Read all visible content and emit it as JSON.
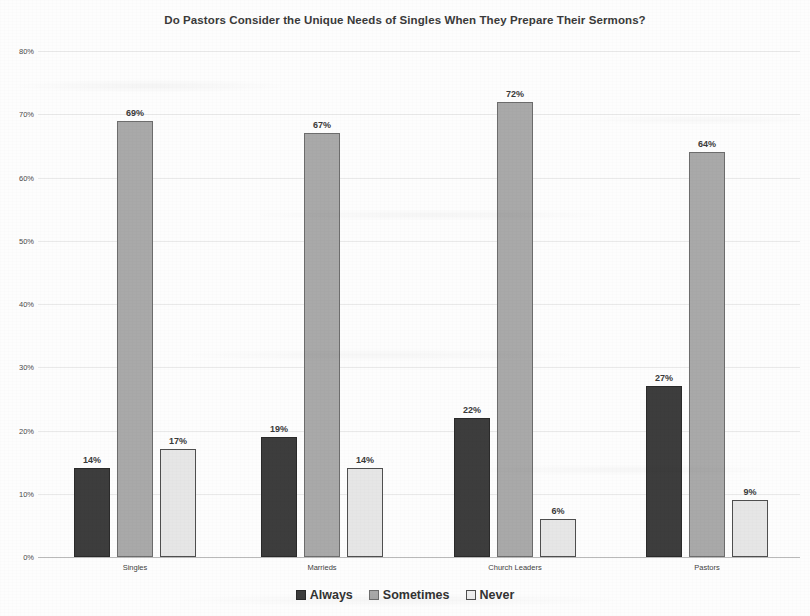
{
  "chart_data": {
    "type": "bar",
    "title": "Do Pastors Consider the Unique Needs of Singles When They Prepare Their Sermons?",
    "xlabel": "",
    "ylabel": "",
    "ylim": [
      0,
      80
    ],
    "ytick_labels": [
      "0%",
      "10%",
      "20%",
      "30%",
      "40%",
      "50%",
      "60%",
      "70%",
      "80%"
    ],
    "ytick_values": [
      0,
      10,
      20,
      30,
      40,
      50,
      60,
      70,
      80
    ],
    "grid": true,
    "legend_position": "bottom",
    "categories": [
      "Singles",
      "Marrieds",
      "Church Leaders",
      "Pastors"
    ],
    "series": [
      {
        "name": "Always",
        "color": "#3d3d3d",
        "values": [
          14,
          19,
          22,
          27
        ],
        "labels": [
          "14%",
          "19%",
          "22%",
          "27%"
        ]
      },
      {
        "name": "Sometimes",
        "color": "#a9a9a9",
        "values": [
          69,
          67,
          72,
          64
        ],
        "labels": [
          "69%",
          "67%",
          "72%",
          "64%"
        ]
      },
      {
        "name": "Never",
        "color": "#e6e6e6",
        "values": [
          17,
          14,
          6,
          9
        ],
        "labels": [
          "17%",
          "14%",
          "6%",
          "9%"
        ]
      }
    ]
  }
}
